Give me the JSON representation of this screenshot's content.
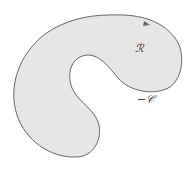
{
  "diagram": {
    "region_label": "ℛ",
    "curve_label": "−𝒞",
    "fill_color": "#e6e6e6",
    "stroke_color": "#666666"
  }
}
